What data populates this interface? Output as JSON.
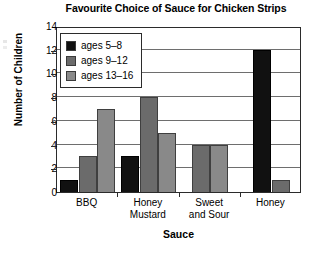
{
  "chart_data": {
    "type": "bar",
    "title": "Favourite Choice of Sauce for Chicken Strips",
    "xlabel": "Sauce",
    "ylabel": "Number of Children",
    "categories": [
      "BBQ",
      "Honey\nMustard",
      "Sweet\nand Sour",
      "Honey"
    ],
    "series": [
      {
        "name": "ages 5–8",
        "values": [
          1,
          3,
          0,
          12
        ],
        "color": "#111111"
      },
      {
        "name": "ages 9–12",
        "values": [
          3,
          8,
          4,
          1
        ],
        "color": "#6b6b6b"
      },
      {
        "name": "ages 13–16",
        "values": [
          7,
          5,
          4,
          0
        ],
        "color": "#898989"
      }
    ],
    "ylim": [
      0,
      14
    ],
    "yticks": [
      0,
      2,
      4,
      6,
      8,
      10,
      12,
      14
    ],
    "ytick_labels": [
      "0",
      "2",
      "4",
      "6",
      "8",
      "10",
      "12",
      "14"
    ],
    "grid": "horizontal",
    "legend_position": "upper-left-inside"
  },
  "legend": {
    "items": [
      {
        "label": "ages 5–8"
      },
      {
        "label": "ages 9–12"
      },
      {
        "label": "ages 13–16"
      }
    ]
  }
}
